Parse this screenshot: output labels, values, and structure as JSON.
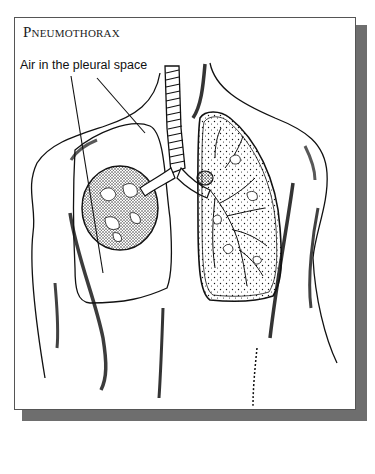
{
  "figure": {
    "title": "Pneumothorax",
    "labels": [
      {
        "text": "Air in the pleural space",
        "points_to": "pleural-air-space"
      }
    ]
  },
  "illustration": {
    "subject": "human torso with collapsed right lung and normal left lung",
    "elements": [
      "trachea",
      "collapsed-lung",
      "normal-lung",
      "pleural-air-space",
      "bronchi",
      "torso-outline"
    ]
  },
  "colors": {
    "ink": "#111111",
    "shadow": "#6e6e6e",
    "border": "#555555",
    "background": "#ffffff"
  }
}
